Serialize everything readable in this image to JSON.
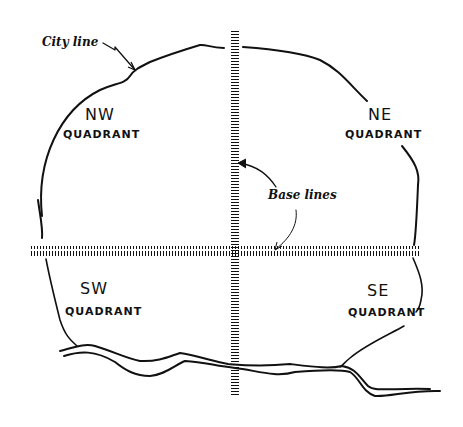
{
  "diagram": {
    "annotations": {
      "city_line": "City line",
      "base_lines": "Base lines"
    },
    "quadrants": [
      {
        "id": "nw",
        "name": "NW",
        "word": "QUADRANT"
      },
      {
        "id": "ne",
        "name": "NE",
        "word": "QUADRANT"
      },
      {
        "id": "sw",
        "name": "SW",
        "word": "QUADRANT"
      },
      {
        "id": "se",
        "name": "SE",
        "word": "QUADRANT"
      }
    ],
    "colors": {
      "ink": "#111111",
      "background": "#ffffff"
    }
  }
}
